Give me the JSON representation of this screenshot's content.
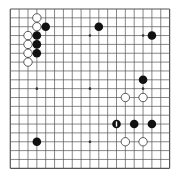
{
  "board": {
    "size": 19,
    "origin_x": 10.3,
    "origin_y": 9,
    "spacing": 8.85,
    "line_color": "#555555",
    "star_points": [
      [
        3,
        3
      ],
      [
        3,
        9
      ],
      [
        3,
        15
      ],
      [
        9,
        3
      ],
      [
        9,
        9
      ],
      [
        9,
        15
      ],
      [
        15,
        3
      ],
      [
        15,
        9
      ],
      [
        15,
        15
      ]
    ],
    "stones": [
      {
        "color": "white",
        "col": 3,
        "row": 1
      },
      {
        "color": "white",
        "col": 3,
        "row": 2
      },
      {
        "color": "black",
        "col": 4,
        "row": 2
      },
      {
        "color": "white",
        "col": 2,
        "row": 3
      },
      {
        "color": "black",
        "col": 3,
        "row": 3
      },
      {
        "color": "white",
        "col": 2,
        "row": 4
      },
      {
        "color": "black",
        "col": 3,
        "row": 4
      },
      {
        "color": "white",
        "col": 2,
        "row": 5
      },
      {
        "color": "black",
        "col": 3,
        "row": 5
      },
      {
        "color": "white",
        "col": 2,
        "row": 6
      },
      {
        "color": "black",
        "col": 10,
        "row": 2
      },
      {
        "color": "black",
        "col": 16,
        "row": 3
      },
      {
        "color": "black",
        "col": 15,
        "row": 8
      },
      {
        "color": "white",
        "col": 13,
        "row": 10
      },
      {
        "color": "white",
        "col": 15,
        "row": 10
      },
      {
        "color": "black",
        "col": 12,
        "row": 13,
        "marked": true
      },
      {
        "color": "black",
        "col": 14,
        "row": 13
      },
      {
        "color": "black",
        "col": 16,
        "row": 13
      },
      {
        "color": "white",
        "col": 13,
        "row": 15
      },
      {
        "color": "white",
        "col": 15,
        "row": 15
      },
      {
        "color": "black",
        "col": 3,
        "row": 15
      }
    ]
  }
}
